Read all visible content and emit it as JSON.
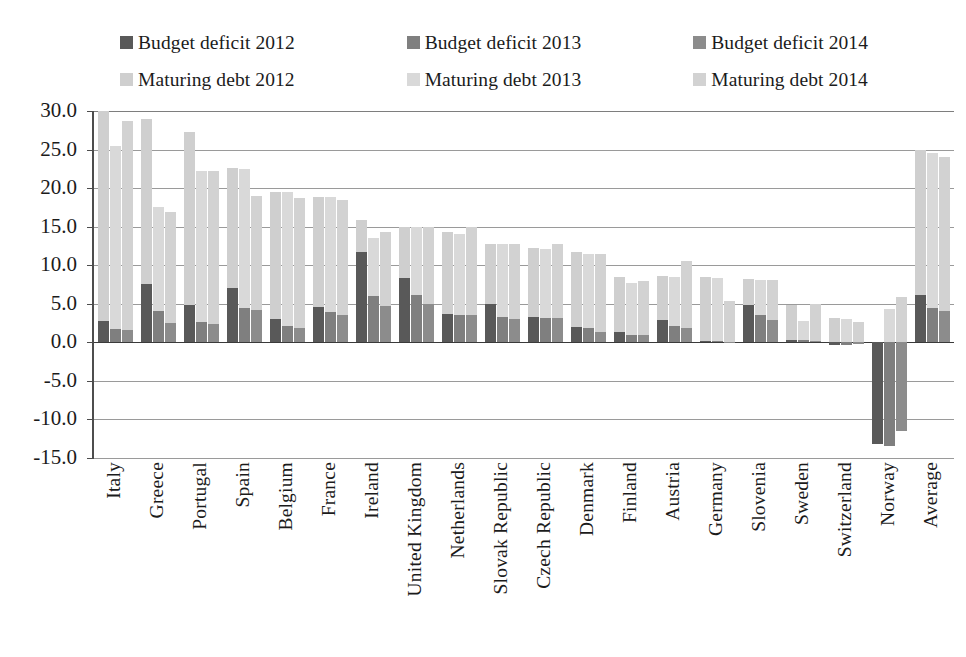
{
  "chart_data": {
    "type": "bar",
    "subtype": "stacked-grouped-column",
    "title": "",
    "subtitle": "",
    "xlabel": "",
    "ylabel": "",
    "ylim": [
      -15.0,
      30.0
    ],
    "ytick_step": 5.0,
    "ytick_labels": [
      "30.0",
      "25.0",
      "20.0",
      "15.0",
      "10.0",
      "5.0",
      "0.0",
      "-5.0",
      "-10.0",
      "-15.0"
    ],
    "ytick_values": [
      30.0,
      25.0,
      20.0,
      15.0,
      10.0,
      5.0,
      0.0,
      -5.0,
      -10.0,
      -15.0
    ],
    "grid": true,
    "grid_axis": "y",
    "legend_position": "top",
    "categories": [
      "Italy",
      "Greece",
      "Portugal",
      "Spain",
      "Belgium",
      "France",
      "Ireland",
      "United Kingdom",
      "Netherlands",
      "Slovak Republic",
      "Czech Republic",
      "Denmark",
      "Finland",
      "Austria",
      "Germany",
      "Slovenia",
      "Sweden",
      "Switzerland",
      "Norway",
      "Average"
    ],
    "series": [
      {
        "name": "Budget deficit 2012",
        "color": "#595959",
        "stack": "2012",
        "values": [
          2.8,
          7.6,
          4.9,
          7.0,
          3.0,
          4.6,
          11.7,
          8.3,
          3.7,
          5.0,
          3.3,
          2.0,
          1.4,
          2.9,
          0.2,
          4.8,
          0.3,
          -0.4,
          -13.2,
          6.2
        ]
      },
      {
        "name": "Budget deficit 2013",
        "color": "#7f7f7f",
        "stack": "2013",
        "values": [
          1.7,
          4.0,
          2.6,
          4.5,
          2.1,
          3.9,
          6.0,
          6.2,
          3.6,
          3.3,
          3.2,
          1.8,
          1.0,
          2.1,
          0.2,
          3.6,
          0.3,
          -0.3,
          -13.5,
          4.5
        ]
      },
      {
        "name": "Budget deficit 2014",
        "color": "#8c8c8c",
        "stack": "2014",
        "values": [
          1.6,
          2.5,
          2.4,
          4.2,
          1.8,
          3.5,
          4.7,
          5.0,
          3.5,
          3.0,
          3.2,
          1.3,
          0.9,
          1.9,
          0.1,
          2.9,
          0.2,
          -0.2,
          -11.5,
          4.0
        ]
      },
      {
        "name": "Maturing debt 2012",
        "color": "#cfcfcf",
        "stack": "2012",
        "values": [
          27.2,
          21.3,
          22.4,
          15.6,
          16.5,
          14.2,
          4.1,
          6.6,
          10.6,
          7.7,
          8.9,
          9.7,
          7.1,
          5.7,
          8.3,
          3.4,
          4.5,
          3.2,
          0.0,
          18.8
        ]
      },
      {
        "name": "Maturing debt 2013",
        "color": "#d9d9d9",
        "stack": "2013",
        "values": [
          23.8,
          13.5,
          19.6,
          18.0,
          17.4,
          14.9,
          7.5,
          8.8,
          10.5,
          9.4,
          8.9,
          9.6,
          6.7,
          6.4,
          8.2,
          4.5,
          2.5,
          3.0,
          4.3,
          20.0
        ]
      },
      {
        "name": "Maturing debt 2014",
        "color": "#d2d2d2",
        "stack": "2014",
        "values": [
          27.1,
          14.4,
          19.8,
          14.8,
          16.9,
          15.0,
          9.6,
          10.0,
          11.4,
          9.7,
          9.5,
          10.2,
          7.0,
          8.7,
          5.3,
          5.2,
          4.8,
          2.7,
          5.9,
          20.0
        ]
      }
    ],
    "stack_totals": {
      "note": "each year column = budget deficit (bottom, dark) stacked with maturing debt (top, light)",
      "2012": [
        30.0,
        28.9,
        27.3,
        22.6,
        19.5,
        18.8,
        15.8,
        14.9,
        14.3,
        12.7,
        12.2,
        11.7,
        8.5,
        8.6,
        8.5,
        8.2,
        4.8,
        2.8,
        -13.2,
        25.0
      ],
      "2013": [
        25.5,
        17.5,
        22.2,
        22.5,
        19.5,
        18.5,
        13.5,
        15.0,
        14.1,
        12.7,
        12.1,
        11.4,
        7.7,
        8.5,
        8.4,
        8.1,
        2.8,
        2.7,
        -13.5,
        24.5
      ],
      "2014": [
        28.7,
        16.9,
        22.2,
        19.0,
        18.7,
        18.5,
        14.3,
        15.0,
        14.9,
        12.7,
        12.7,
        11.5,
        7.9,
        10.6,
        5.4,
        8.1,
        5.0,
        2.5,
        -11.5,
        24.0
      ]
    }
  },
  "legend": {
    "rows": [
      [
        {
          "label": "Budget deficit 2012",
          "color": "#595959"
        },
        {
          "label": "Budget deficit 2013",
          "color": "#7f7f7f"
        },
        {
          "label": "Budget deficit 2014",
          "color": "#8c8c8c"
        }
      ],
      [
        {
          "label": "Maturing debt 2012",
          "color": "#cfcfcf"
        },
        {
          "label": "Maturing debt 2013",
          "color": "#d9d9d9"
        },
        {
          "label": "Maturing debt 2014",
          "color": "#d2d2d2"
        }
      ]
    ]
  },
  "colors": {
    "axis": "#4d4d4d",
    "grid": "#9a9a9a",
    "zero_line": "#3a3a3a",
    "text": "#1b1b1b",
    "background": "#ffffff"
  }
}
